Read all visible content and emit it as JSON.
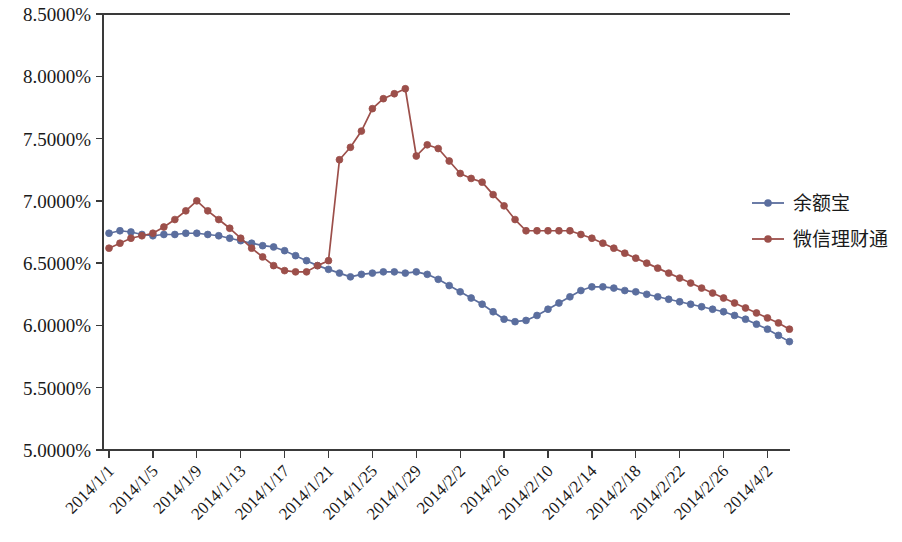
{
  "chart_data": {
    "type": "line",
    "title": "",
    "subtitle": "",
    "xlabel": "",
    "ylabel": "",
    "ylim": [
      5.0,
      8.5
    ],
    "ytick_step": 0.5,
    "ytick_labels": [
      "5.0000%",
      "5.5000%",
      "6.0000%",
      "6.5000%",
      "7.0000%",
      "7.5000%",
      "8.0000%",
      "8.5000%"
    ],
    "ytick_values": [
      5.0,
      5.5,
      6.0,
      6.5,
      7.0,
      7.5,
      8.0,
      8.5
    ],
    "grid": false,
    "legend_position": "right",
    "x_label_interval": 4,
    "xtick_labels": [
      "2014/1/1",
      "2014/1/5",
      "2014/1/9",
      "2014/1/13",
      "2014/1/17",
      "2014/1/21",
      "2014/1/25",
      "2014/1/29",
      "2014/2/2",
      "2014/2/6",
      "2014/2/10",
      "2014/2/14",
      "2014/2/18",
      "2014/2/22",
      "2014/2/26",
      "2014/4/2"
    ],
    "x": [
      "2014/1/1",
      "2014/1/2",
      "2014/1/3",
      "2014/1/4",
      "2014/1/5",
      "2014/1/6",
      "2014/1/7",
      "2014/1/8",
      "2014/1/9",
      "2014/1/10",
      "2014/1/11",
      "2014/1/12",
      "2014/1/13",
      "2014/1/14",
      "2014/1/15",
      "2014/1/16",
      "2014/1/17",
      "2014/1/18",
      "2014/1/19",
      "2014/1/20",
      "2014/1/21",
      "2014/1/22",
      "2014/1/23",
      "2014/1/24",
      "2014/1/25",
      "2014/1/26",
      "2014/1/27",
      "2014/1/28",
      "2014/1/29",
      "2014/1/30",
      "2014/1/31",
      "2014/2/1",
      "2014/2/2",
      "2014/2/3",
      "2014/2/4",
      "2014/2/5",
      "2014/2/6",
      "2014/2/7",
      "2014/2/8",
      "2014/2/9",
      "2014/2/10",
      "2014/2/11",
      "2014/2/12",
      "2014/2/13",
      "2014/2/14",
      "2014/2/15",
      "2014/2/16",
      "2014/2/17",
      "2014/2/18",
      "2014/2/19",
      "2014/2/20",
      "2014/2/21",
      "2014/2/22",
      "2014/2/23",
      "2014/2/24",
      "2014/2/25",
      "2014/2/26",
      "2014/2/27",
      "2014/2/28",
      "2014/3/1",
      "2014/4/2",
      "2014/4/3",
      "2014/4/4"
    ],
    "series": [
      {
        "name": "余额宝",
        "color": "#5B6E9E",
        "marker": "circle",
        "values": [
          6.74,
          6.76,
          6.75,
          6.73,
          6.72,
          6.73,
          6.73,
          6.74,
          6.74,
          6.73,
          6.72,
          6.7,
          6.68,
          6.66,
          6.64,
          6.63,
          6.6,
          6.56,
          6.52,
          6.48,
          6.45,
          6.42,
          6.39,
          6.41,
          6.42,
          6.43,
          6.43,
          6.42,
          6.43,
          6.41,
          6.37,
          6.32,
          6.27,
          6.22,
          6.17,
          6.11,
          6.05,
          6.03,
          6.04,
          6.08,
          6.13,
          6.18,
          6.23,
          6.28,
          6.31,
          6.31,
          6.3,
          6.28,
          6.27,
          6.25,
          6.23,
          6.21,
          6.19,
          6.17,
          6.15,
          6.13,
          6.11,
          6.08,
          6.05,
          6.01,
          5.97,
          5.92,
          5.87
        ]
      },
      {
        "name": "微信理财通",
        "color": "#9C4F4A",
        "marker": "circle",
        "values": [
          6.62,
          6.66,
          6.7,
          6.72,
          6.74,
          6.79,
          6.85,
          6.92,
          7.0,
          6.92,
          6.85,
          6.78,
          6.7,
          6.62,
          6.55,
          6.48,
          6.44,
          6.43,
          6.43,
          6.48,
          6.52,
          7.33,
          7.43,
          7.56,
          7.74,
          7.82,
          7.86,
          7.9,
          7.36,
          7.45,
          7.42,
          7.32,
          7.22,
          7.18,
          7.15,
          7.05,
          6.96,
          6.85,
          6.76,
          6.76,
          6.76,
          6.76,
          6.76,
          6.73,
          6.7,
          6.66,
          6.62,
          6.58,
          6.54,
          6.5,
          6.46,
          6.42,
          6.38,
          6.34,
          6.3,
          6.26,
          6.22,
          6.18,
          6.14,
          6.1,
          6.06,
          6.02,
          5.97
        ]
      }
    ]
  },
  "legend": {
    "items": [
      {
        "label": "余额宝",
        "color": "#5B6E9E"
      },
      {
        "label": "微信理财通",
        "color": "#9C4F4A"
      }
    ]
  }
}
